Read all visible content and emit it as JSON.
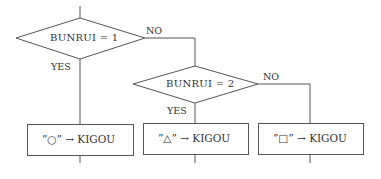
{
  "diagram": {
    "type": "flowchart",
    "decisions": [
      {
        "id": "d1",
        "text": "BUNRUI = 1",
        "yes_label": "YES",
        "no_label": "NO"
      },
      {
        "id": "d2",
        "text": "BUNRUI = 2",
        "yes_label": "YES",
        "no_label": "NO"
      }
    ],
    "processes": [
      {
        "id": "p1",
        "text": "”○” → KIGOU"
      },
      {
        "id": "p2",
        "text": "”△” → KIGOU"
      },
      {
        "id": "p3",
        "text": "”□” → KIGOU"
      }
    ],
    "line_color": "#555555",
    "text_color": "#333333"
  }
}
